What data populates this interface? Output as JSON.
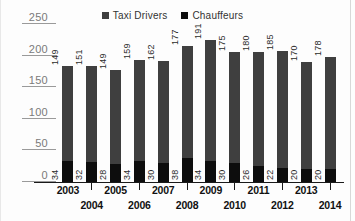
{
  "chart_data": {
    "type": "bar",
    "subtype": "stacked-bar",
    "title": "",
    "subtitle": "",
    "xlabel": "",
    "ylabel": "",
    "categories": [
      "2003",
      "2004",
      "2005",
      "2006",
      "2007",
      "2008",
      "2009",
      "2010",
      "2011",
      "2012",
      "2013",
      "2014"
    ],
    "series": [
      {
        "name": "Chauffeurs",
        "color": "#0d0d0d",
        "stack_position": "bottom",
        "values": [
          34,
          32,
          28,
          34,
          30,
          38,
          34,
          30,
          26,
          22,
          20,
          20
        ]
      },
      {
        "name": "Taxi Drivers",
        "color": "#3f3f3f",
        "stack_position": "top",
        "values": [
          149,
          151,
          149,
          159,
          162,
          177,
          191,
          175,
          180,
          185,
          170,
          178
        ]
      }
    ],
    "totals": [
      183,
      183,
      177,
      193,
      192,
      215,
      225,
      205,
      206,
      207,
      190,
      198
    ],
    "ylim": [
      0,
      250
    ],
    "yticks": [
      0,
      50,
      100,
      150,
      200,
      250
    ],
    "ytick_labels": [
      "0",
      "50",
      "100",
      "150",
      "200",
      "250"
    ],
    "grid": "horizontal-stubs",
    "legend_position": "top-right",
    "data_labels": true,
    "data_label_orientation": "vertical"
  },
  "legend": {
    "items": [
      {
        "label": "Taxi Drivers",
        "color": "#3f3f3f"
      },
      {
        "label": "Chauffeurs",
        "color": "#0d0d0d"
      }
    ]
  },
  "axis": {
    "y_ticks": [
      {
        "label": "250",
        "value": 250
      },
      {
        "label": "200",
        "value": 200
      },
      {
        "label": "150",
        "value": 150
      },
      {
        "label": "100",
        "value": 100
      },
      {
        "label": "50",
        "value": 50
      },
      {
        "label": "0",
        "value": 0
      }
    ],
    "x_categories": [
      {
        "label": "2003",
        "row": 0
      },
      {
        "label": "2004",
        "row": 1
      },
      {
        "label": "2005",
        "row": 0
      },
      {
        "label": "2006",
        "row": 1
      },
      {
        "label": "2007",
        "row": 0
      },
      {
        "label": "2008",
        "row": 1
      },
      {
        "label": "2009",
        "row": 0
      },
      {
        "label": "2010",
        "row": 1
      },
      {
        "label": "2011",
        "row": 0
      },
      {
        "label": "2012",
        "row": 1
      },
      {
        "label": "2013",
        "row": 0
      },
      {
        "label": "2014",
        "row": 1
      }
    ]
  },
  "colors": {
    "taxi_drivers": "#3f3f3f",
    "chauffeurs": "#0d0d0d",
    "gridline": "#9a9a9a",
    "axis": "#1a1a1a",
    "ytick_text": "#7a7a7a",
    "background": "#fdfdfd"
  }
}
